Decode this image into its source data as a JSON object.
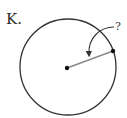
{
  "figure": {
    "label": "K.",
    "question_mark": "?",
    "colors": {
      "circle": "#333333",
      "radius_line": "#8a8a8a",
      "points": "#111111",
      "arrow": "#333333"
    },
    "circle": {
      "cx": 68,
      "cy": 67,
      "r": 48
    },
    "center_point": {
      "x": 67,
      "y": 68
    },
    "edge_point": {
      "x": 113,
      "y": 51
    },
    "arrow": {
      "from": [
        116,
        27
      ],
      "to": [
        89,
        55
      ]
    }
  }
}
